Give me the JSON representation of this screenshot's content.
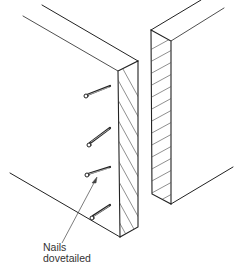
{
  "diagram": {
    "title": "",
    "stroke_color": "#222222",
    "background": "#ffffff",
    "annotations": [
      {
        "line1": "Nails",
        "line2": "dovetailed"
      }
    ],
    "components": [
      {
        "name": "left-board",
        "end_grain": "hatched"
      },
      {
        "name": "right-board",
        "end_grain": "hatched"
      },
      {
        "name": "nails",
        "count": 4
      }
    ]
  }
}
